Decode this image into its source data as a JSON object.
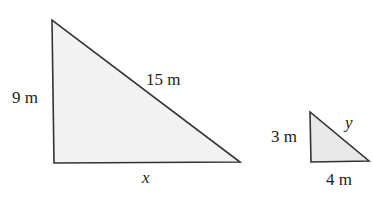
{
  "diagram": {
    "colors": {
      "stroke": "#333333",
      "fill": "#f2f2f2"
    },
    "large_triangle": {
      "vertical_side": "9 m",
      "hypotenuse": "15 m",
      "base": "x"
    },
    "small_triangle": {
      "vertical_side": "3 m",
      "hypotenuse": "y",
      "base": "4 m"
    }
  }
}
